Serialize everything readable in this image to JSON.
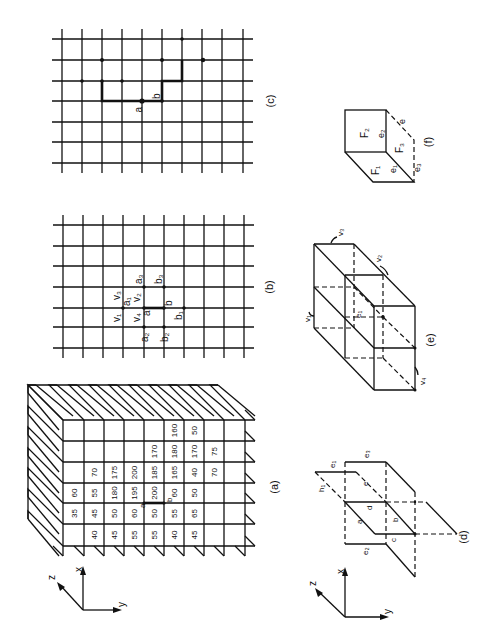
{
  "figure": {
    "orientation": "rotated-90-ccw",
    "panels": {
      "a": {
        "caption": "(a)",
        "grid_x": [
          63,
          84,
          104,
          124,
          144,
          164,
          184,
          204,
          224,
          245
        ],
        "grid_y": [
          420,
          441,
          462,
          483,
          503,
          524,
          546
        ],
        "cells": [
          {
            "col": 0,
            "row": 3,
            "v": "60"
          },
          {
            "col": 0,
            "row": 4,
            "v": "35"
          },
          {
            "col": 1,
            "row": 2,
            "v": "70"
          },
          {
            "col": 1,
            "row": 3,
            "v": "55"
          },
          {
            "col": 1,
            "row": 4,
            "v": "45"
          },
          {
            "col": 1,
            "row": 5,
            "v": "40"
          },
          {
            "col": 2,
            "row": 2,
            "v": "175"
          },
          {
            "col": 2,
            "row": 3,
            "v": "180"
          },
          {
            "col": 2,
            "row": 4,
            "v": "50"
          },
          {
            "col": 2,
            "row": 5,
            "v": "45"
          },
          {
            "col": 3,
            "row": 2,
            "v": "200"
          },
          {
            "col": 3,
            "row": 3,
            "v": "195"
          },
          {
            "col": 3,
            "row": 4,
            "v": "60"
          },
          {
            "col": 3,
            "row": 5,
            "v": "55"
          },
          {
            "col": 4,
            "row": 1,
            "v": "170"
          },
          {
            "col": 4,
            "row": 2,
            "v": "185"
          },
          {
            "col": 4,
            "row": 3,
            "v": "200"
          },
          {
            "col": 4,
            "row": 4,
            "v": "50"
          },
          {
            "col": 4,
            "row": 5,
            "v": "55"
          },
          {
            "col": 5,
            "row": 0,
            "v": "160"
          },
          {
            "col": 5,
            "row": 1,
            "v": "180"
          },
          {
            "col": 5,
            "row": 2,
            "v": "165"
          },
          {
            "col": 5,
            "row": 3,
            "v": "60"
          },
          {
            "col": 5,
            "row": 4,
            "v": "55"
          },
          {
            "col": 5,
            "row": 5,
            "v": "40"
          },
          {
            "col": 6,
            "row": 0,
            "v": "50"
          },
          {
            "col": 6,
            "row": 1,
            "v": "170"
          },
          {
            "col": 6,
            "row": 2,
            "v": "40"
          },
          {
            "col": 6,
            "row": 3,
            "v": "50"
          },
          {
            "col": 6,
            "row": 4,
            "v": "65"
          },
          {
            "col": 6,
            "row": 5,
            "v": "45"
          },
          {
            "col": 7,
            "row": 1,
            "v": "75"
          },
          {
            "col": 7,
            "row": 2,
            "v": "70"
          }
        ],
        "edge_labels": {
          "a": "a",
          "b": "b"
        },
        "axes": {
          "x": "x",
          "y": "y",
          "z": "z"
        }
      },
      "b": {
        "caption": "(b)",
        "grid_x": [
          63,
          83,
          103,
          123,
          144,
          164,
          184,
          204,
          224,
          244
        ],
        "grid_y": [
          225,
          246,
          266,
          287,
          308,
          327,
          348
        ],
        "labels": {
          "a": "a",
          "b": "b",
          "a1": "a₁",
          "a2": "a₂",
          "a3": "a₃",
          "b1": "b₁",
          "b2": "b₂",
          "b3": "b₃",
          "v1": "v₁",
          "v2": "v₂",
          "v3": "v₃",
          "v4": "v₄"
        }
      },
      "c": {
        "caption": "(c)",
        "grid_x": [
          62,
          82,
          102,
          122,
          142,
          162,
          182,
          202,
          222,
          243
        ],
        "grid_y": [
          39,
          60,
          81,
          101,
          122,
          142,
          163
        ],
        "labels": {
          "a": "a",
          "b": "b"
        }
      },
      "d": {
        "caption": "(d)",
        "labels": {
          "a": "a",
          "b": "b",
          "c": "c",
          "d": "d",
          "e": "e",
          "e1": "e₁",
          "e2": "e₂",
          "e3": "e₃",
          "h1": "h₁"
        },
        "axes": {
          "x": "x",
          "y": "y",
          "z": "z"
        }
      },
      "e": {
        "caption": "(e)",
        "labels": {
          "v1": "v₁",
          "v2": "v₂",
          "v3": "v₃",
          "v4": "v₄",
          "e1": "e₁"
        }
      },
      "f": {
        "caption": "(f)",
        "labels": {
          "F1": "F₁",
          "F2": "F₂",
          "F3": "F₃",
          "e": "e",
          "e1": "e₁",
          "e2": "e₂",
          "e3": "e₃"
        }
      }
    }
  }
}
